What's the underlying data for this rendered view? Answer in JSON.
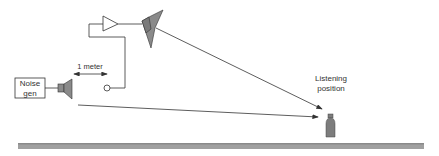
{
  "diagram": {
    "noise_generator": {
      "line1": "Noise",
      "line2": "gen"
    },
    "distance_label": "1 meter",
    "listener": {
      "line1": "Listening",
      "line2": "position"
    },
    "colors": {
      "stroke": "#333333",
      "speaker_fill": "#8a8a8a",
      "listener_fill": "#7d7d7d",
      "floor_fill": "#a0a0a0"
    },
    "components": [
      "noise-generator",
      "reference-speaker",
      "measurement-microphone",
      "amplifier",
      "playback-speaker",
      "listener",
      "floor"
    ]
  }
}
